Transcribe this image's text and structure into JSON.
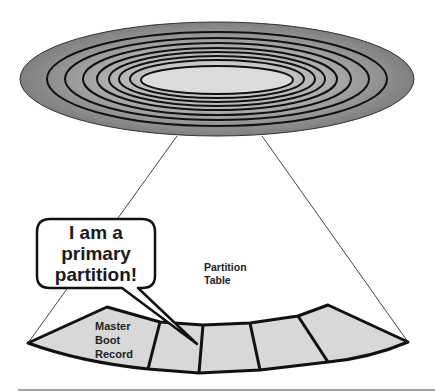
{
  "diagram": {
    "colors": {
      "platter_outer": "#8c8c8c",
      "platter_inner": "#d6d6d6",
      "sector_fill": "#d8d8d8",
      "outline": "#111111"
    },
    "platter": {
      "ring_count": 8
    },
    "speech_bubble": {
      "line1": "I am a",
      "line2": "primary",
      "line3": "partition!"
    },
    "labels": {
      "partition_table_line1": "Partition",
      "partition_table_line2": "Table",
      "mbr_line1": "Master",
      "mbr_line2": "Boot",
      "mbr_line3": "Record"
    },
    "sector": {
      "segments": [
        "Master Boot Record",
        "Partition 1",
        "Partition 2",
        "Partition 3",
        "Partition 4"
      ]
    }
  }
}
